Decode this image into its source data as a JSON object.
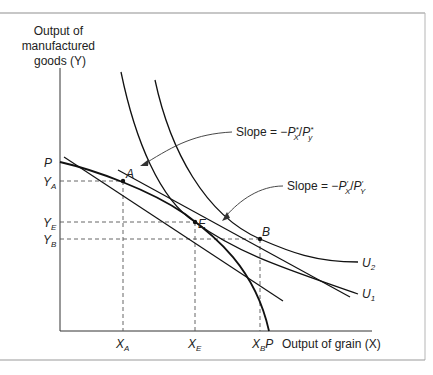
{
  "figure": {
    "y_axis_label_lines": [
      "Output of",
      "manufactured",
      "goods (Y)"
    ],
    "x_axis_label": "Output of grain (X)",
    "y_ticks": [
      {
        "main": "P",
        "sub": "",
        "y": 162
      },
      {
        "main": "Y",
        "sub": "A",
        "y": 181
      },
      {
        "main": "Y",
        "sub": "E",
        "y": 222
      },
      {
        "main": "Y",
        "sub": "B",
        "y": 239
      }
    ],
    "x_ticks": [
      {
        "main": "X",
        "sub": "A",
        "x": 123
      },
      {
        "main": "X",
        "sub": "E",
        "x": 195
      },
      {
        "main": "X",
        "sub": "B",
        "x": 260
      },
      {
        "main": "P",
        "sub": "",
        "x": 269
      }
    ],
    "points": [
      {
        "label": "A",
        "x": 123,
        "y": 181
      },
      {
        "label": "E",
        "x": 195,
        "y": 222
      },
      {
        "label": "B",
        "x": 260,
        "y": 239
      }
    ],
    "curves": {
      "ppf_label": "P",
      "indifference": [
        {
          "main": "U",
          "sub": "2"
        },
        {
          "main": "U",
          "sub": "1"
        }
      ]
    },
    "annotations": [
      {
        "text": "Slope = −P′X/P′y",
        "prefix": "Slope = −",
        "p1": "P",
        "s1": "X",
        "p2": "P",
        "s2": "y",
        "mark": "*"
      },
      {
        "text": "Slope = −P′X/P′Y",
        "prefix": "Slope = −",
        "p1": "P",
        "s1": "X",
        "p2": "P",
        "s2": "Y",
        "mark": "′"
      }
    ],
    "colors": {
      "ink": "#1a1a1a",
      "frame": "#9a9a9a",
      "background": "#ffffff"
    }
  }
}
